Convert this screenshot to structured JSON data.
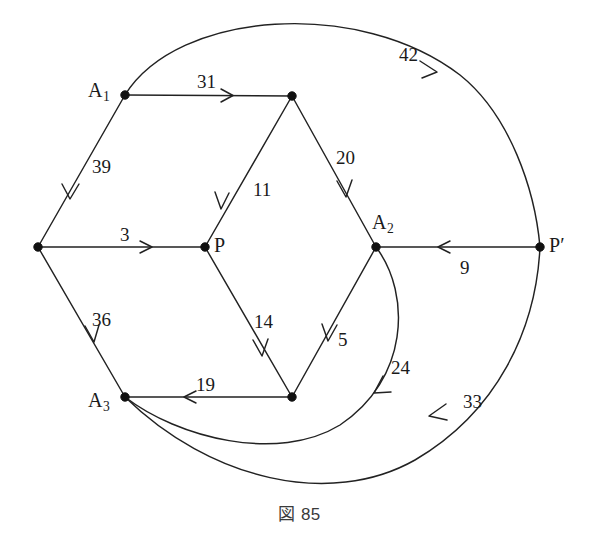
{
  "figure": {
    "caption": "図 85",
    "caption_number": "85",
    "background_color": "#ffffff",
    "ink_color": "#222222",
    "width": 599,
    "height": 553
  },
  "graph": {
    "type": "directed-weighted-network",
    "nodes": [
      {
        "id": "A1",
        "label": "A",
        "sub": "1",
        "prime": "",
        "x": 125,
        "y": 95,
        "label_x": 88,
        "label_y": 80,
        "has_label": true
      },
      {
        "id": "T",
        "label": "",
        "sub": "",
        "prime": "",
        "x": 292,
        "y": 96,
        "label_x": 0,
        "label_y": 0,
        "has_label": false
      },
      {
        "id": "L",
        "label": "",
        "sub": "",
        "prime": "",
        "x": 38,
        "y": 247,
        "label_x": 0,
        "label_y": 0,
        "has_label": false
      },
      {
        "id": "P",
        "label": "P",
        "sub": "",
        "prime": "",
        "x": 205,
        "y": 247,
        "label_x": 214,
        "label_y": 235,
        "has_label": true
      },
      {
        "id": "A2",
        "label": "A",
        "sub": "2",
        "prime": "",
        "x": 376,
        "y": 247,
        "label_x": 372,
        "label_y": 212,
        "has_label": true
      },
      {
        "id": "Pp",
        "label": "P",
        "sub": "",
        "prime": "′",
        "x": 540,
        "y": 247,
        "label_x": 549,
        "label_y": 235,
        "has_label": true
      },
      {
        "id": "A3",
        "label": "A",
        "sub": "3",
        "prime": "",
        "x": 125,
        "y": 397,
        "label_x": 88,
        "label_y": 390,
        "has_label": true
      },
      {
        "id": "B",
        "label": "",
        "sub": "",
        "prime": "",
        "x": 292,
        "y": 397,
        "label_x": 0,
        "label_y": 0,
        "has_label": false
      }
    ],
    "edges": [
      {
        "id": "e31",
        "from": "A1",
        "to": "T",
        "weight": "31",
        "shape": "straight",
        "label_x": 197,
        "label_y": 72,
        "arrow_t": 0.62
      },
      {
        "id": "e39",
        "from": "A1",
        "to": "L",
        "weight": "39",
        "shape": "straight",
        "label_x": 92,
        "label_y": 157,
        "arrow_t": 0.66
      },
      {
        "id": "e3",
        "from": "L",
        "to": "P",
        "weight": "3",
        "shape": "straight",
        "label_x": 120,
        "label_y": 225,
        "arrow_t": 0.64
      },
      {
        "id": "e36",
        "from": "L",
        "to": "A3",
        "weight": "36",
        "shape": "straight",
        "label_x": 92,
        "label_y": 310,
        "arrow_t": 0.62
      },
      {
        "id": "e11",
        "from": "T",
        "to": "P",
        "weight": "11",
        "shape": "straight",
        "label_x": 253,
        "label_y": 180,
        "arrow_t": 0.7
      },
      {
        "id": "e20",
        "from": "T",
        "to": "A2",
        "weight": "20",
        "shape": "straight",
        "label_x": 336,
        "label_y": 148,
        "arrow_t": 0.66
      },
      {
        "id": "e14",
        "from": "P",
        "to": "B",
        "weight": "14",
        "shape": "straight",
        "label_x": 254,
        "label_y": 312,
        "arrow_t": 0.72
      },
      {
        "id": "e5",
        "from": "A2",
        "to": "B",
        "weight": "5",
        "shape": "straight",
        "label_x": 338,
        "label_y": 330,
        "arrow_t": 0.62
      },
      {
        "id": "e19",
        "from": "B",
        "to": "A3",
        "weight": "19",
        "shape": "straight",
        "label_x": 196,
        "label_y": 375,
        "arrow_t": 0.62
      },
      {
        "id": "e9",
        "from": "Pp",
        "to": "A2",
        "weight": "9",
        "shape": "straight",
        "label_x": 460,
        "label_y": 258,
        "arrow_t": 0.58
      },
      {
        "id": "e42",
        "from": "A1",
        "to": "Pp",
        "weight": "42",
        "shape": "arc-top",
        "label_x": 399,
        "label_y": 45,
        "arrow_t": 0.56
      },
      {
        "id": "e33",
        "from": "Pp",
        "to": "A3",
        "weight": "33",
        "shape": "arc-bottom",
        "label_x": 463,
        "label_y": 392,
        "arrow_t": 0.36
      },
      {
        "id": "e24",
        "from": "A2",
        "to": "A3",
        "weight": "24",
        "shape": "arc-inner",
        "label_x": 391,
        "label_y": 358,
        "arrow_t": 0.34
      }
    ],
    "node_radius": 4.2
  }
}
